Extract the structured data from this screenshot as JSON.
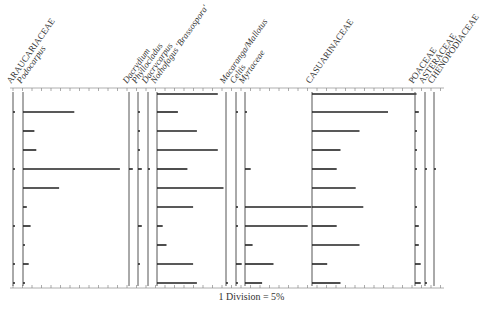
{
  "chart_data": {
    "type": "bar",
    "subtype": "pollen-diagram",
    "title": "",
    "scale_caption": "1 Division = 5%",
    "units": "% pollen",
    "sample_rows": 10,
    "row_y": [
      94,
      112,
      131,
      150,
      169,
      188,
      207,
      226,
      245,
      264,
      283
    ],
    "axis": {
      "top_y": 88,
      "bottom_y": 288,
      "left_x": 10,
      "right_x": 444,
      "px_per_percent": 1.9,
      "division_percent": 5
    },
    "series": [
      {
        "name": "ARAUCARIACEAE",
        "italic": false,
        "x": 13,
        "values": [
          0,
          1,
          0,
          0,
          1,
          0,
          0,
          1,
          0,
          1,
          1
        ]
      },
      {
        "name": "Podocarpus",
        "italic": true,
        "x": 23,
        "values": [
          0,
          27,
          6,
          7,
          51,
          19,
          2,
          4,
          1,
          3,
          1
        ]
      },
      {
        "name": "Dacrydium",
        "italic": true,
        "x": 129,
        "values": [
          0,
          0,
          0,
          0,
          2,
          0,
          0,
          0,
          0,
          0,
          0
        ]
      },
      {
        "name": "Phyllocladus",
        "italic": true,
        "x": 138,
        "values": [
          0,
          1,
          1,
          1,
          2,
          0,
          0,
          2,
          0,
          1,
          0
        ]
      },
      {
        "name": "Dacrycarpus",
        "italic": true,
        "x": 148,
        "values": [
          0,
          0,
          0,
          0,
          1,
          0,
          0,
          0,
          0,
          0,
          0
        ]
      },
      {
        "name": "Nothofagus 'Brassospora'",
        "italic": true,
        "x": 157,
        "values": [
          32,
          11,
          21,
          32,
          16,
          35,
          19,
          3,
          5,
          19,
          21
        ]
      },
      {
        "name": "Macaranga/Mallotus",
        "italic": true,
        "x": 226,
        "values": [
          0,
          0,
          0,
          0,
          0,
          0,
          0,
          0,
          0,
          0,
          1
        ]
      },
      {
        "name": "Celtis",
        "italic": true,
        "x": 236,
        "values": [
          0,
          1,
          0,
          0,
          0,
          0,
          1,
          1,
          0,
          3,
          1
        ]
      },
      {
        "name": "Myrtaceae",
        "italic": true,
        "x": 245,
        "values": [
          0,
          1,
          0,
          0,
          3,
          0,
          35,
          33,
          4,
          15,
          9
        ]
      },
      {
        "name": "CASUARINACEAE",
        "italic": false,
        "x": 312,
        "values": [
          55,
          40,
          25,
          15,
          13,
          23,
          27,
          13,
          25,
          8,
          15
        ]
      },
      {
        "name": "POACEAE",
        "italic": false,
        "x": 415,
        "values": [
          0,
          2,
          1,
          1,
          1,
          0,
          1,
          2,
          2,
          3,
          3
        ]
      },
      {
        "name": "ASTERACEAE",
        "italic": false,
        "x": 425,
        "values": [
          0,
          0,
          0,
          0,
          1,
          0,
          0,
          0,
          0,
          0,
          1
        ]
      },
      {
        "name": "CHENOPODIACEAE",
        "italic": false,
        "x": 434,
        "values": [
          0,
          0,
          0,
          0,
          1,
          0,
          0,
          0,
          0,
          0,
          0
        ]
      }
    ],
    "xlabel": "1 Division = 5%",
    "ylabel": "",
    "grid": false,
    "legend": "none"
  }
}
